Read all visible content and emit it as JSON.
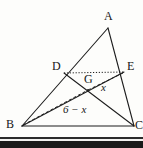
{
  "figure": {
    "type": "euclidean-geometry-diagram",
    "canvas": {
      "width": 143,
      "height": 148
    },
    "stroke_color": "#1d1d1d",
    "background_color": "#fdfdfb",
    "vertices": [
      {
        "id": "A",
        "label": "A",
        "x": 108,
        "y": 28,
        "label_x": 104,
        "label_y": 10
      },
      {
        "id": "B",
        "label": "B",
        "x": 22,
        "y": 126,
        "label_x": 6,
        "label_y": 118
      },
      {
        "id": "C",
        "label": "C",
        "x": 134,
        "y": 126,
        "label_x": 135,
        "label_y": 119
      },
      {
        "id": "D",
        "label": "D",
        "x": 64,
        "y": 73,
        "label_x": 52,
        "label_y": 60
      },
      {
        "id": "E",
        "label": "E",
        "x": 124,
        "y": 72,
        "label_x": 127,
        "label_y": 60
      },
      {
        "id": "G",
        "label": "G",
        "x": 88,
        "y": 90,
        "label_x": 84,
        "label_y": 73
      }
    ],
    "solid_segments": [
      {
        "name": "side-AB",
        "from": "A",
        "to": "B"
      },
      {
        "name": "side-AC",
        "from": "A",
        "to": "C"
      },
      {
        "name": "side-BC",
        "from": "B",
        "to": "C"
      },
      {
        "name": "cevian-DC",
        "from": "D",
        "to": "C"
      },
      {
        "name": "cevian-BE",
        "from": "B",
        "to": "E"
      }
    ],
    "dotted_segments": [
      {
        "name": "segment-DE",
        "from": "D",
        "to": "E"
      }
    ],
    "dashed_segments": [
      {
        "name": "dashed-BG",
        "from": "B",
        "to": "G"
      },
      {
        "name": "dashed-GE",
        "from": "G",
        "to": "E"
      }
    ],
    "measure_labels": [
      {
        "id": "seg-x",
        "text": "x",
        "x": 101,
        "y": 82,
        "refers_to": "GE"
      },
      {
        "id": "seg-6-minus-x",
        "text": "6 − x",
        "x": 63,
        "y": 104,
        "refers_to": "BG"
      }
    ],
    "bottom_rules": {
      "thin_rule_color": "#2b2b2b",
      "thick_rule_color": "#1a1a1a",
      "gap_color": "#f2f2f0"
    }
  }
}
